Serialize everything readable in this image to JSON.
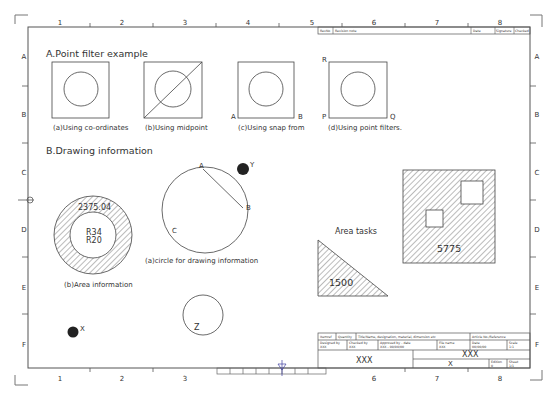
{
  "sheet": {
    "column_labels": [
      "1",
      "2",
      "3",
      "4",
      "5",
      "6",
      "7",
      "8"
    ],
    "row_labels": [
      "A",
      "B",
      "C",
      "D",
      "E",
      "F"
    ]
  },
  "revision_block": {
    "revno": "RevNo",
    "revision_note": "Revision note",
    "date": "Date",
    "signature": "Signature",
    "checked": "Checked"
  },
  "section_a": {
    "title": "A.Point filter example",
    "panels": [
      {
        "caption": "(a)Using co-ordinates"
      },
      {
        "caption": "(b)Using midpoint"
      },
      {
        "caption": "(c)Using snap from",
        "corner_left": "A",
        "corner_right": "B"
      },
      {
        "caption": "(d)Using point filters.",
        "corner_top": "R",
        "corner_left": "P",
        "corner_right": "Q"
      }
    ]
  },
  "section_b": {
    "title": "B.Drawing information",
    "area_info": {
      "value": "2375.04",
      "r_outer": "R34",
      "r_inner": "R20",
      "caption": "(b)Area information"
    },
    "circle_info": {
      "point_a": "A",
      "point_b": "B",
      "point_c": "C",
      "caption": "(a)circle for drawing information"
    },
    "point_y": "Y",
    "point_x": "X",
    "circle_z": "Z"
  },
  "area_tasks": {
    "title": "Area tasks",
    "triangle_area": "1500",
    "square_area": "5775"
  },
  "title_block": {
    "item_ref": "Itemref",
    "quantity": "Quantity",
    "title_names": "Title/Name, designation, material, dimension etc",
    "article_ref": "Article No./Reference",
    "designed_by_label": "Designed by",
    "designed_by": "XXX",
    "checked_by_label": "Checked by",
    "checked_by": "XXX",
    "approved_label": "Approved by - date",
    "approved": "XXX - 00/00/00",
    "file_name_label": "File name",
    "file_name": "XXX",
    "date_label": "Date",
    "date": "00/00/00",
    "scale_label": "Scale",
    "scale": "1:1",
    "company": "XXX",
    "title": "XXX",
    "drawing_no": "X",
    "edition_label": "Edition",
    "edition": "0",
    "sheet_label": "Sheet",
    "sheet": "1/1"
  }
}
